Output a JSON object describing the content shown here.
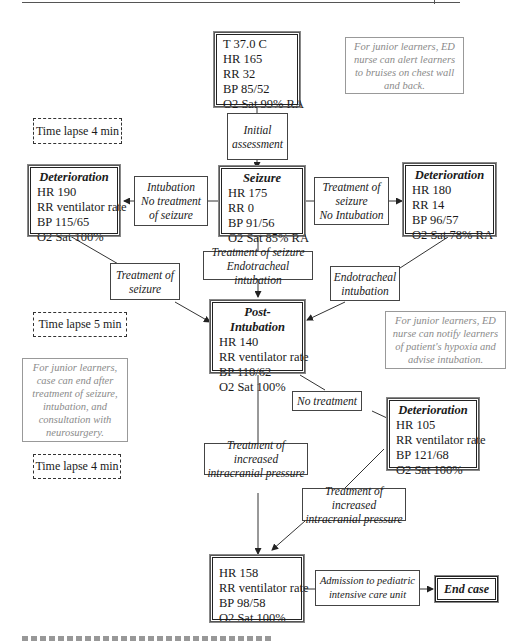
{
  "nodes": {
    "initial": {
      "lines": [
        "T 37.0 C",
        "HR 165",
        "RR 32",
        "BP 85/52",
        "O2 Sat 99% RA"
      ]
    },
    "seizure": {
      "title": "Seizure",
      "lines": [
        "HR 175",
        "RR 0",
        "BP 91/56",
        "O2 Sat 85% RA"
      ]
    },
    "deterioration_left": {
      "title": "Deterioration",
      "lines": [
        "HR 190",
        "RR ventilator rate",
        "BP 115/65",
        "O2 Sat 100%"
      ]
    },
    "deterioration_right": {
      "title": "Deterioration",
      "lines": [
        "HR 180",
        "RR 14",
        "BP 96/57",
        "O2 Sat 78% RA"
      ]
    },
    "post_intubation": {
      "title": "Post-Intubation",
      "lines": [
        "HR 140",
        "RR ventilator rate",
        "BP 110/62",
        "O2 Sat 100%"
      ]
    },
    "deterioration_lower": {
      "title": "Deterioration",
      "lines": [
        "HR 105",
        "RR ventilator rate",
        "BP 121/68",
        "O2 Sat 100%"
      ]
    },
    "final": {
      "lines": [
        "HR 158",
        "RR ventilator rate",
        "BP 98/58",
        "O2 Sat 100%"
      ]
    },
    "end_case": {
      "label": "End case"
    }
  },
  "transitions": {
    "initial_assessment": [
      "Initial",
      "assessment"
    ],
    "intubation_no_treatment": [
      "Intubation",
      "No treatment",
      "of seizure"
    ],
    "treatment_no_intubation": [
      "Treatment of",
      "seizure",
      "No Intubation"
    ],
    "treatment_and_intubation": [
      "Treatment of seizure",
      "Endotracheal intubation"
    ],
    "treatment_of_seizure": [
      "Treatment of",
      "seizure"
    ],
    "endotracheal_intubation": [
      "Endotracheal",
      "intubation"
    ],
    "no_treatment": [
      "No treatment"
    ],
    "icp_treatment_left": [
      "Treatment of increased",
      "intracranial pressure"
    ],
    "icp_treatment_right": [
      "Treatment of increased",
      "intracranial pressure"
    ],
    "picu_admission": [
      "Admission to pediatric",
      "intensive care unit"
    ]
  },
  "notes": {
    "bruises": "For junior learners, ED nurse can alert learners to bruises on chest wall and back.",
    "hypoxia": "For junior learners, ED nurse can notify learners of patient's hypoxia and advise intubation.",
    "case_end": "For junior learners, case can end after treatment of seizure, intubation, and consultation with neurosurgery."
  },
  "time_lapses": [
    "Time lapse 4 min",
    "Time lapse 5 min",
    "Time lapse 4 min"
  ]
}
